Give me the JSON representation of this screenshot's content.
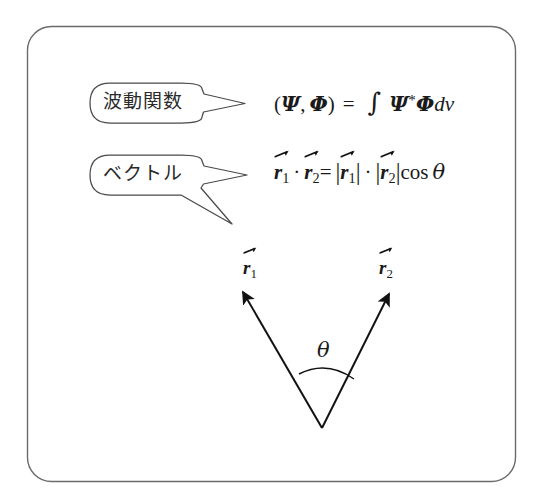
{
  "figure": {
    "background_color": "#ffffff",
    "frame_color": "#6b6b6b",
    "ink_color": "#1a1a1a",
    "callouts": [
      {
        "id": "wave-function",
        "label": "波動関数",
        "points_to": "formula-1"
      },
      {
        "id": "vector",
        "label": "ベクトル",
        "points_to": "formula-2 and vector-diagram"
      }
    ],
    "formulas": [
      {
        "id": "inner-product",
        "plain_text": "(Ψ, Φ) = ∫ Ψ*Φ dv",
        "lhs_open": "(",
        "lhs_psi": "Ψ",
        "lhs_comma": ",",
        "lhs_phi": "Φ",
        "lhs_close": ")",
        "equals": "=",
        "integral": "∫",
        "rhs_psi": "Ψ",
        "rhs_star": "*",
        "rhs_phi": "Φ",
        "rhs_dv": "dv"
      },
      {
        "id": "dot-product",
        "plain_text": "r⃗1 · r⃗2 = |r⃗1| · |r⃗2| cos θ",
        "r": "r",
        "sub1": "1",
        "sub2": "2",
        "dot": "·",
        "equals": "=",
        "bar": "|",
        "cos": "cos",
        "theta": "θ"
      }
    ],
    "diagram": {
      "id": "vector-diagram",
      "label_r1": {
        "symbol": "r",
        "subscript": "1"
      },
      "label_r2": {
        "symbol": "r",
        "subscript": "2"
      },
      "angle_label": "θ",
      "origin": {
        "x": 322,
        "y": 428
      },
      "vector1_tip": {
        "x": 241,
        "y": 289
      },
      "vector2_tip": {
        "x": 391,
        "y": 291
      },
      "arc_start": {
        "x": 299,
        "y": 374
      },
      "arc_end": {
        "x": 354,
        "y": 379
      }
    }
  }
}
